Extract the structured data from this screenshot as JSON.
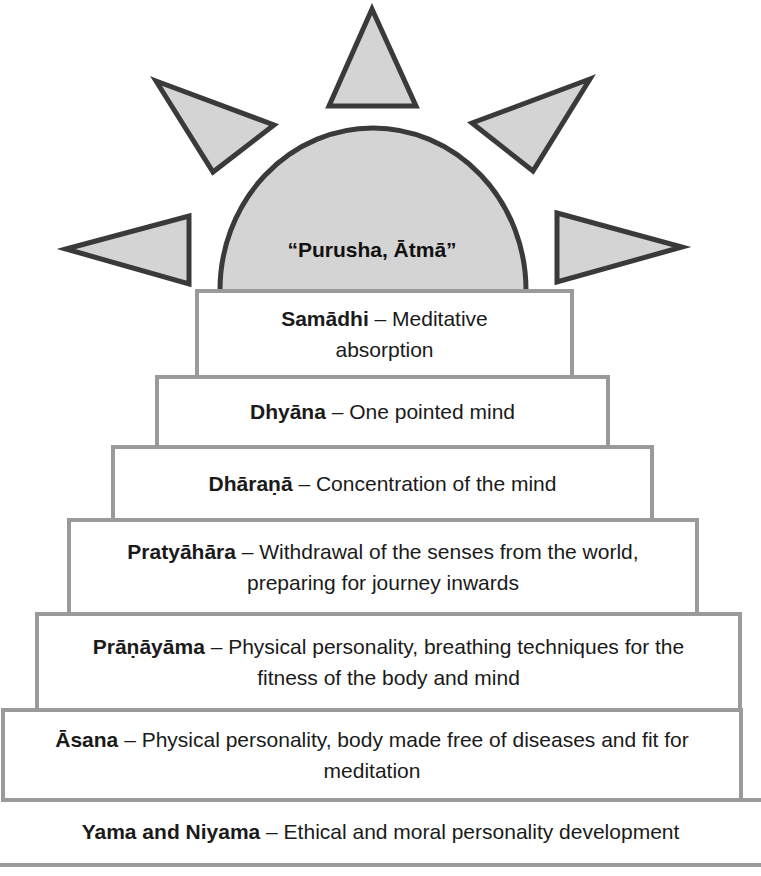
{
  "diagram": {
    "type": "stepped pyramid with sun",
    "sun": {
      "label": "“Purusha, Ātmā”",
      "fill_color": "#d4d4d4",
      "stroke_color": "#3a3a3a",
      "rays": 5
    },
    "steps": [
      {
        "term": "Samādhi",
        "separator": " – ",
        "description": "Meditative absorption"
      },
      {
        "term": "Dhyāna",
        "separator": " – ",
        "description": "One pointed mind"
      },
      {
        "term": "Dhāraṇā",
        "separator": " – ",
        "description": "Concentration of the mind"
      },
      {
        "term": "Pratyāhāra",
        "separator": " – ",
        "description": "Withdrawal of the senses from the world, preparing for journey inwards"
      },
      {
        "term": "Prāṇāyāma",
        "separator": " – ",
        "description": "Physical personality, breathing techniques for the fitness of the body and mind"
      },
      {
        "term": "Āsana",
        "separator": " – ",
        "description": "Physical personality, body made free of diseases and fit for meditation"
      }
    ],
    "base": {
      "term": "Yama and Niyama",
      "separator": " – ",
      "description": "Ethical and moral personality development"
    },
    "colors": {
      "box_border": "#9a9a9a",
      "box_fill": "#ffffff",
      "text": "#1a1a1a"
    }
  }
}
